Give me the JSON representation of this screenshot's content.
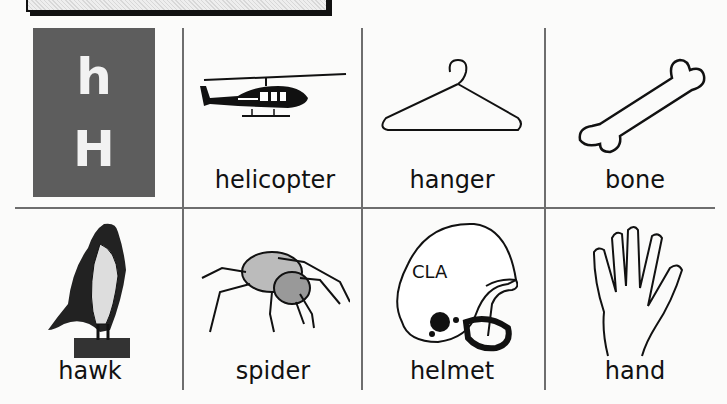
{
  "worksheet": {
    "letter_card": {
      "lowercase": "h",
      "uppercase": "H",
      "tile_color": "#5d5d5d"
    },
    "cards": [
      {
        "word": "helicopter",
        "picture": "helicopter-icon",
        "row": 1,
        "col": 2
      },
      {
        "word": "hanger",
        "picture": "hanger-icon",
        "row": 1,
        "col": 3
      },
      {
        "word": "bone",
        "picture": "bone-icon",
        "row": 1,
        "col": 4
      },
      {
        "word": "hawk",
        "picture": "hawk-icon",
        "row": 2,
        "col": 1
      },
      {
        "word": "spider",
        "picture": "spider-icon",
        "row": 2,
        "col": 2
      },
      {
        "word": "helmet",
        "picture": "helmet-icon",
        "row": 2,
        "col": 3,
        "helmet_text": "CLA"
      },
      {
        "word": "hand",
        "picture": "hand-icon",
        "row": 2,
        "col": 4
      }
    ]
  }
}
